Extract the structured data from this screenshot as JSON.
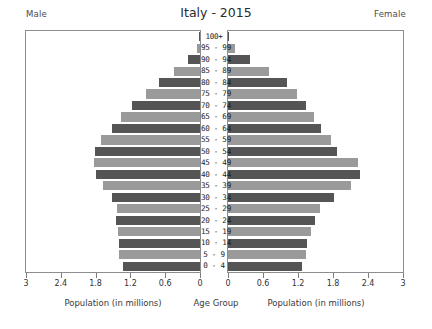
{
  "header": {
    "male_label": "Male",
    "female_label": "Female",
    "title": "Italy - 2015"
  },
  "axis": {
    "male_caption": "Population (in millions)",
    "center_caption": "Age Group",
    "female_caption": "Population (in millions)",
    "male_ticks": [
      "3",
      "2.4",
      "1.8",
      "1.2",
      "0.6",
      "0"
    ],
    "female_ticks": [
      "0",
      "0.6",
      "1.2",
      "1.8",
      "2.4",
      "3"
    ]
  },
  "colors": {
    "bar_light": "#9a9a9a",
    "bar_dark": "#555555",
    "frame": "#8d8d8d",
    "text": "#3a3a3a",
    "background": "#ffffff"
  },
  "chart_data": {
    "type": "bar",
    "title": "Italy - 2015",
    "subtitle": "",
    "xlabel": "Population (in millions)",
    "ylabel": "Age Group",
    "xlim": [
      0,
      3
    ],
    "grid": false,
    "legend": [
      "Male",
      "Female"
    ],
    "legend_position": "top-corners",
    "orientation": "population-pyramid",
    "categories": [
      "100+",
      "95 - 99",
      "90 - 94",
      "85 - 89",
      "80 - 84",
      "75 - 79",
      "70 - 74",
      "65 - 69",
      "60 - 64",
      "55 - 59",
      "50 - 54",
      "45 - 49",
      "40 - 44",
      "35 - 39",
      "30 - 34",
      "25 - 29",
      "20 - 24",
      "15 - 19",
      "10 - 14",
      "5 - 9",
      "0 - 4"
    ],
    "series": [
      {
        "name": "Male",
        "side": "left",
        "values": [
          0.01,
          0.06,
          0.2,
          0.44,
          0.71,
          0.93,
          1.18,
          1.37,
          1.52,
          1.7,
          1.81,
          1.83,
          1.79,
          1.67,
          1.51,
          1.43,
          1.45,
          1.42,
          1.4,
          1.39,
          1.33
        ]
      },
      {
        "name": "Female",
        "side": "right",
        "values": [
          0.02,
          0.12,
          0.37,
          0.7,
          1.01,
          1.18,
          1.33,
          1.47,
          1.59,
          1.76,
          1.87,
          2.23,
          2.27,
          2.1,
          1.82,
          1.58,
          1.49,
          1.42,
          1.36,
          1.34,
          1.27
        ]
      }
    ]
  }
}
